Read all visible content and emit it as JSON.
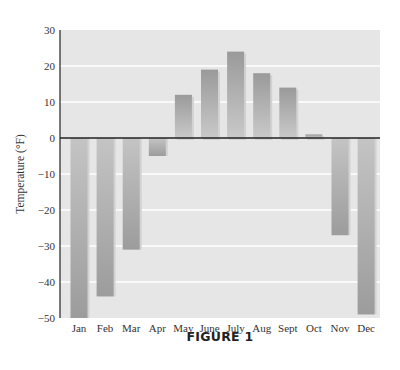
{
  "chart_data": {
    "type": "bar",
    "title": "",
    "caption": "FIGURE 1",
    "xlabel": "",
    "ylabel": "Temperature (°F)",
    "categories": [
      "Jan",
      "Feb",
      "Mar",
      "Apr",
      "May",
      "June",
      "July",
      "Aug",
      "Sept",
      "Oct",
      "Nov",
      "Dec"
    ],
    "values": [
      -50,
      -44,
      -31,
      -5,
      12,
      19,
      24,
      18,
      14,
      1,
      -27,
      -49
    ],
    "ylim": [
      -50,
      30
    ],
    "yticks": [
      30,
      20,
      10,
      0,
      -10,
      -20,
      -30,
      -40,
      -50
    ],
    "ytick_labels": [
      "30",
      "20",
      "10",
      "0",
      "−10",
      "−20",
      "−30",
      "−40",
      "−50"
    ],
    "grid": true,
    "legend": null,
    "colors": {
      "plot_background": "#e6e6e6",
      "gridline": "#ffffff",
      "bar_top": "#999999",
      "bar_bottom": "#c8c8c8",
      "axis": "#222222",
      "zero_line": "#222222"
    }
  }
}
